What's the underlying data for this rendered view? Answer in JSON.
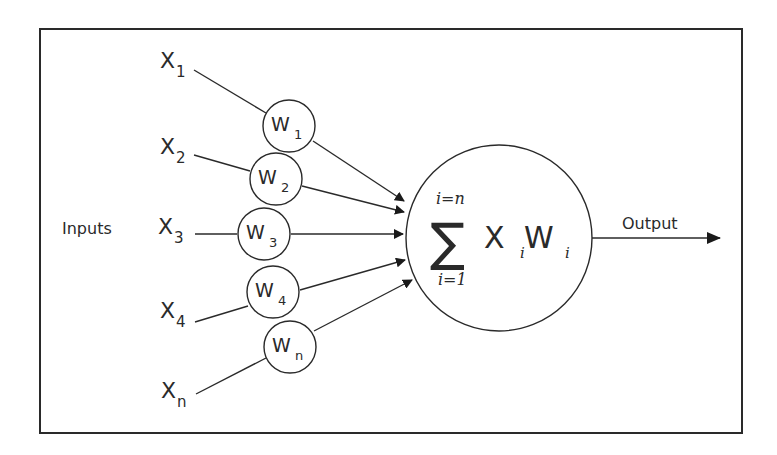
{
  "diagram": {
    "inputs_label": "Inputs",
    "output_label": "Output",
    "inputs": [
      {
        "base": "X",
        "sub": "1"
      },
      {
        "base": "X",
        "sub": "2"
      },
      {
        "base": "X",
        "sub": "3"
      },
      {
        "base": "X",
        "sub": "4"
      },
      {
        "base": "X",
        "sub": "n"
      }
    ],
    "weights": [
      {
        "base": "W",
        "sub": "1"
      },
      {
        "base": "W",
        "sub": "2"
      },
      {
        "base": "W",
        "sub": "3"
      },
      {
        "base": "W",
        "sub": "4"
      },
      {
        "base": "W",
        "sub": "n"
      }
    ],
    "summation": {
      "symbol": "∑",
      "upper": "i=n",
      "lower": "i=1",
      "term_x": "X",
      "term_x_sub": "i",
      "term_w": "W",
      "term_w_sub": "i"
    },
    "colors": {
      "stroke": "#2a2a2a",
      "background": "#ffffff"
    }
  }
}
